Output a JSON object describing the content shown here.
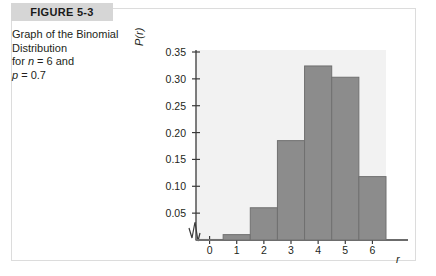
{
  "figure": {
    "header_label": "FIGURE 5-3",
    "caption_lines": [
      "Graph of the Binomial",
      "Distribution",
      "for n = 6 and",
      "p = 0.7"
    ]
  },
  "colors": {
    "bar_fill": "#8c8c8c",
    "bar_stroke": "#707070",
    "plot_background": "#f2f2f2",
    "header_band": "#d6d6d6",
    "card_border": "#dcdcdc",
    "text": "#231f20"
  },
  "chart_data": {
    "type": "bar",
    "title": "",
    "subtitle": "",
    "xlabel": "r",
    "ylabel": "P(r)",
    "categories": [
      "0",
      "1",
      "2",
      "3",
      "4",
      "5",
      "6"
    ],
    "values": [
      0.001,
      0.01,
      0.06,
      0.185,
      0.324,
      0.303,
      0.118
    ],
    "ylim": [
      0,
      0.35
    ],
    "yticks": [
      0.05,
      0.1,
      0.15,
      0.2,
      0.25,
      0.3,
      0.35
    ],
    "ytick_labels": [
      "0.05",
      "0.10",
      "0.15",
      "0.20",
      "0.25",
      "0.30",
      "0.35"
    ],
    "xticks": [
      "0",
      "1",
      "2",
      "3",
      "4",
      "5",
      "6"
    ],
    "grid": false,
    "legend": "none",
    "axis_break": true,
    "annotations": []
  }
}
